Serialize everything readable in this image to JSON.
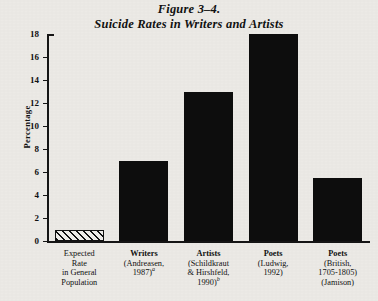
{
  "figure": {
    "number_line": "Figure 3–4.",
    "title_line": "Suicide Rates in Writers and Artists"
  },
  "chart_data": {
    "type": "bar",
    "title": "Suicide Rates in Writers and Artists",
    "xlabel": "",
    "ylabel": "Percentage",
    "ylim": [
      0,
      18
    ],
    "ytick_values": [
      0,
      2,
      4,
      6,
      8,
      10,
      12,
      14,
      16,
      18
    ],
    "ytick_labels": [
      "0",
      "2",
      "4",
      "6",
      "8",
      "10",
      "12",
      "14",
      "16",
      "18"
    ],
    "grid": false,
    "legend": "none",
    "categories": [
      "Expected Rate in General Population",
      "Writers (Andreasen, 1987)a",
      "Artists (Schildkraut & Hirshfeld, 1990)b",
      "Poets (Ludwig, 1992)",
      "Poets (British, 1705-1805) (Jamison)"
    ],
    "values": [
      1.0,
      7.0,
      13.0,
      18.0,
      5.5
    ],
    "bar_styles": [
      "hatched",
      "solid",
      "solid",
      "solid",
      "solid"
    ],
    "bar_color": "#0d0d0d"
  },
  "categories": [
    {
      "name": "Expected",
      "name_bold": false,
      "lines": [
        "Rate",
        "in General",
        "Population"
      ],
      "superscript": ""
    },
    {
      "name": "Writers",
      "name_bold": true,
      "lines": [
        "(Andreasen,",
        "1987)"
      ],
      "superscript": "a"
    },
    {
      "name": "Artists",
      "name_bold": true,
      "lines": [
        "(Schildkraut",
        "& Hirshfeld,",
        "1990)"
      ],
      "superscript": "b"
    },
    {
      "name": "Poets",
      "name_bold": true,
      "lines": [
        "(Ludwig,",
        "1992)"
      ],
      "superscript": ""
    },
    {
      "name": "Poets",
      "name_bold": true,
      "lines": [
        "(British,",
        "1705-1805)",
        "(Jamison)"
      ],
      "superscript": ""
    }
  ]
}
